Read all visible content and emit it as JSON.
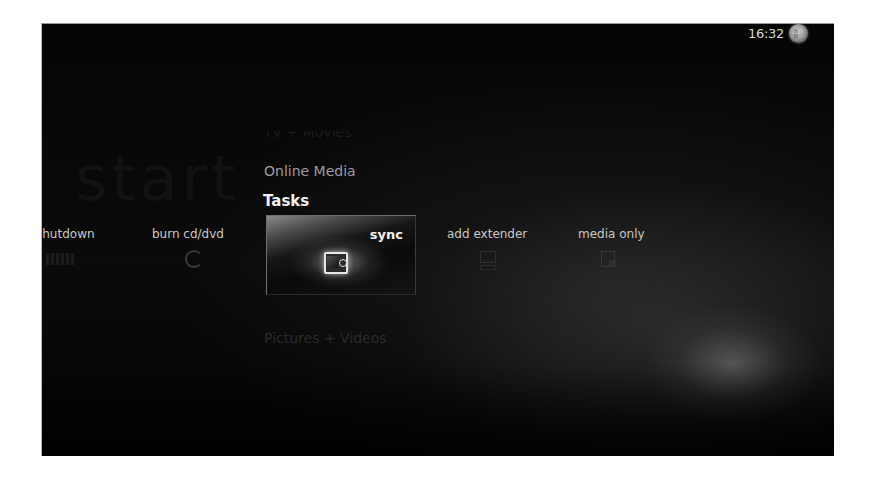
{
  "app": {
    "name": "Windows Media Center",
    "screen": "start"
  },
  "header": {
    "clock": "16:32",
    "logo_icon": "windows-orb-icon"
  },
  "watermark": "start",
  "menu": {
    "items": [
      {
        "label": "TV + Movies",
        "state": "faded"
      },
      {
        "label": "Online Media",
        "state": "normal"
      },
      {
        "label": "Tasks",
        "state": "selected"
      },
      {
        "label": "Pictures + Videos",
        "state": "faded"
      }
    ]
  },
  "tasks": {
    "items": [
      {
        "label": "shutdown",
        "icon": "shutdown-icon",
        "selected": false
      },
      {
        "label": "burn cd/dvd",
        "icon": "disc-icon",
        "selected": false
      },
      {
        "label": "sync",
        "icon": "portable-device-icon",
        "selected": true
      },
      {
        "label": "add extender",
        "icon": "monitor-icon",
        "selected": false
      },
      {
        "label": "media only",
        "icon": "media-only-icon",
        "selected": false
      }
    ]
  },
  "colors": {
    "background": "#050505",
    "text_selected": "#f0f0f0",
    "text_normal": "#c8c8c8",
    "text_faded": "#2a2a2a"
  }
}
